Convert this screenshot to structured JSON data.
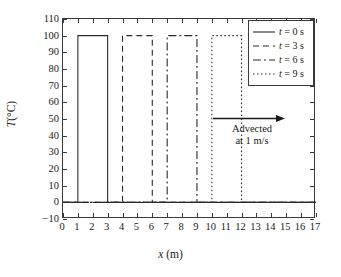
{
  "chart_data": {
    "type": "line",
    "title": "",
    "xlabel": "x (m)",
    "xlabel_symbol": "x",
    "xlabel_unit": "(m)",
    "ylabel": "T (°C)",
    "ylabel_symbol": "T",
    "ylabel_unit": "(°C)",
    "xlim": [
      0,
      17
    ],
    "ylim": [
      -10,
      110
    ],
    "xticks": [
      0,
      1,
      2,
      3,
      4,
      5,
      6,
      7,
      8,
      9,
      10,
      11,
      12,
      13,
      14,
      15,
      16,
      17
    ],
    "yticks": [
      -10,
      0,
      10,
      20,
      30,
      40,
      50,
      60,
      70,
      80,
      90,
      100,
      110
    ],
    "grid": false,
    "legend_position": "upper right",
    "baseline": 0,
    "pulse_height": 100,
    "series": [
      {
        "name": "t = 0 s",
        "label_symbol": "t",
        "label_value": "= 0 s",
        "linestyle": "solid",
        "dasharray": "",
        "color": "#2b2b2b",
        "pulse_start": 1,
        "pulse_end": 3,
        "x": [
          0,
          1,
          1,
          3,
          3,
          17
        ],
        "y": [
          0,
          0,
          100,
          100,
          0,
          0
        ]
      },
      {
        "name": "t = 3 s",
        "label_symbol": "t",
        "label_value": "= 3 s",
        "linestyle": "dashed",
        "dasharray": "6,4",
        "color": "#2b2b2b",
        "pulse_start": 4,
        "pulse_end": 6,
        "x": [
          0,
          4,
          4,
          6,
          6,
          17
        ],
        "y": [
          0,
          0,
          100,
          100,
          0,
          0
        ]
      },
      {
        "name": "t = 6 s",
        "label_symbol": "t",
        "label_value": "= 6 s",
        "linestyle": "dashdot",
        "dasharray": "8,3,2,3",
        "color": "#2b2b2b",
        "pulse_start": 7,
        "pulse_end": 9,
        "x": [
          0,
          7,
          7,
          9,
          9,
          17
        ],
        "y": [
          0,
          0,
          100,
          100,
          0,
          0
        ]
      },
      {
        "name": "t = 9 s",
        "label_symbol": "t",
        "label_value": "= 9 s",
        "linestyle": "dotted",
        "dasharray": "1.5,2.5",
        "color": "#2b2b2b",
        "pulse_start": 10,
        "pulse_end": 12,
        "x": [
          0,
          10,
          10,
          12,
          12,
          17
        ],
        "y": [
          0,
          0,
          100,
          100,
          0,
          0
        ]
      }
    ],
    "annotations": [
      {
        "name": "advection-note",
        "line1": "Advected",
        "line2": "at 1 m/s",
        "arrow": "right",
        "x": 13.8,
        "y": 45
      }
    ]
  },
  "colors": {
    "axis": "#3a3a3a",
    "line": "#2b2b2b",
    "background": "#ffffff",
    "text": "#1a1a1a"
  }
}
